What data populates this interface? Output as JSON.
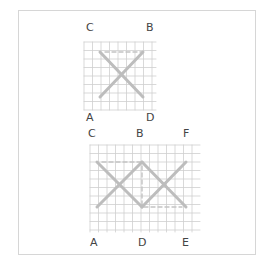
{
  "figure": {
    "top_diagram": {
      "labels": [
        {
          "id": "C",
          "text": "C",
          "x": 86,
          "y": 22
        },
        {
          "id": "B",
          "text": "B",
          "x": 146,
          "y": 22
        },
        {
          "id": "A",
          "text": "A",
          "x": 86,
          "y": 112
        },
        {
          "id": "D",
          "text": "D",
          "x": 146,
          "y": 112
        }
      ],
      "grid": {
        "x0": 84,
        "x1": 156,
        "y0": 42,
        "y1": 110,
        "step": 8.5
      },
      "solid_lines": [
        [
          100,
          52,
          143,
          97
        ],
        [
          143,
          52,
          100,
          97
        ]
      ],
      "dashed_lines": [
        [
          105,
          52,
          143,
          52
        ]
      ]
    },
    "bottom_diagram": {
      "labels": [
        {
          "id": "C",
          "text": "C",
          "x": 88,
          "y": 128
        },
        {
          "id": "B",
          "text": "B",
          "x": 136,
          "y": 128
        },
        {
          "id": "F",
          "text": "F",
          "x": 183,
          "y": 128
        },
        {
          "id": "A",
          "text": "A",
          "x": 90,
          "y": 237
        },
        {
          "id": "D",
          "text": "D",
          "x": 138,
          "y": 237
        },
        {
          "id": "E",
          "text": "E",
          "x": 182,
          "y": 237
        }
      ],
      "grid": {
        "x0": 90,
        "x1": 200,
        "y0": 145,
        "y1": 232,
        "step": 8.5
      },
      "solid_lines": [
        [
          97,
          162,
          142,
          207
        ],
        [
          142,
          207,
          186,
          162
        ],
        [
          97,
          207,
          142,
          162
        ],
        [
          142,
          162,
          186,
          207
        ]
      ],
      "dashed_lines": [
        [
          102,
          162,
          140,
          162
        ],
        [
          142,
          166,
          142,
          205
        ],
        [
          144,
          207,
          182,
          207
        ]
      ]
    },
    "colors": {
      "grid": "#cfcfcf",
      "solid": "#bdbdbd",
      "dashed": "#c4c4c4",
      "frame": "#d6d6d6",
      "label": "#444444"
    }
  }
}
